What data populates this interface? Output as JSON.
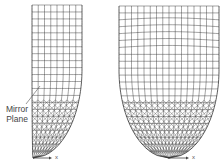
{
  "figure": {
    "left_panel": {
      "name": "half-model-mesh",
      "label_line1": "Mirror",
      "label_line2": "Plane",
      "axis_label": "x",
      "bbox": {
        "x0": 32,
        "x1": 82,
        "top": 5,
        "bottom": 158
      },
      "mesh": {
        "cols": 8,
        "rows": 22,
        "stroke": "#333333"
      }
    },
    "right_panel": {
      "name": "full-model-mesh",
      "axis_label": "x",
      "bbox": {
        "x0": 119,
        "x1": 219,
        "top": 6,
        "bottom": 158
      },
      "mesh": {
        "cols": 16,
        "rows": 22,
        "stroke": "#333333"
      }
    }
  }
}
